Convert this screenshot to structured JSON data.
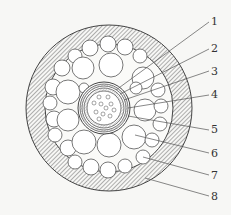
{
  "diagram": {
    "type": "cable-cross-section",
    "callouts": [
      {
        "id": "1",
        "label": "1",
        "x": 211,
        "y": 16
      },
      {
        "id": "2",
        "label": "2",
        "x": 211,
        "y": 43
      },
      {
        "id": "3",
        "label": "3",
        "x": 211,
        "y": 66
      },
      {
        "id": "4",
        "label": "4",
        "x": 211,
        "y": 89
      },
      {
        "id": "5",
        "label": "5",
        "x": 211,
        "y": 124
      },
      {
        "id": "6",
        "label": "6",
        "x": 211,
        "y": 148
      },
      {
        "id": "7",
        "label": "7",
        "x": 211,
        "y": 170
      },
      {
        "id": "8",
        "label": "8",
        "x": 211,
        "y": 191
      }
    ],
    "colors": {
      "line": "#444444",
      "background": "#f7f7f5",
      "fill": "#ffffff"
    }
  }
}
